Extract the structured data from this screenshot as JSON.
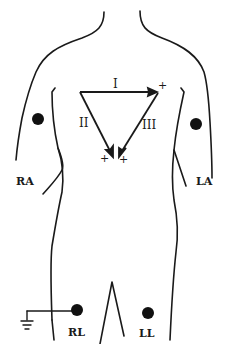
{
  "diagram": {
    "colors": {
      "ink": "#1a1a1a",
      "background": "#ffffff"
    },
    "electrodes": [
      {
        "id": "RA",
        "label": "RA",
        "x": 38,
        "y": 120
      },
      {
        "id": "LA",
        "label": "LA",
        "x": 196,
        "y": 125
      },
      {
        "id": "RL",
        "label": "RL",
        "x": 77,
        "y": 309
      },
      {
        "id": "LL",
        "label": "LL",
        "x": 148,
        "y": 314
      }
    ],
    "leads": [
      {
        "id": "I",
        "label": "I",
        "from": "right-arm",
        "to": "left-arm",
        "polarity": "+"
      },
      {
        "id": "II",
        "label": "II",
        "from": "right-arm",
        "to": "left-leg",
        "polarity": "+"
      },
      {
        "id": "III",
        "label": "III",
        "from": "left-arm",
        "to": "left-leg",
        "polarity": "+"
      }
    ],
    "plus_signs": [
      "+",
      "+",
      "+"
    ],
    "ground_symbol": "ground-icon"
  }
}
